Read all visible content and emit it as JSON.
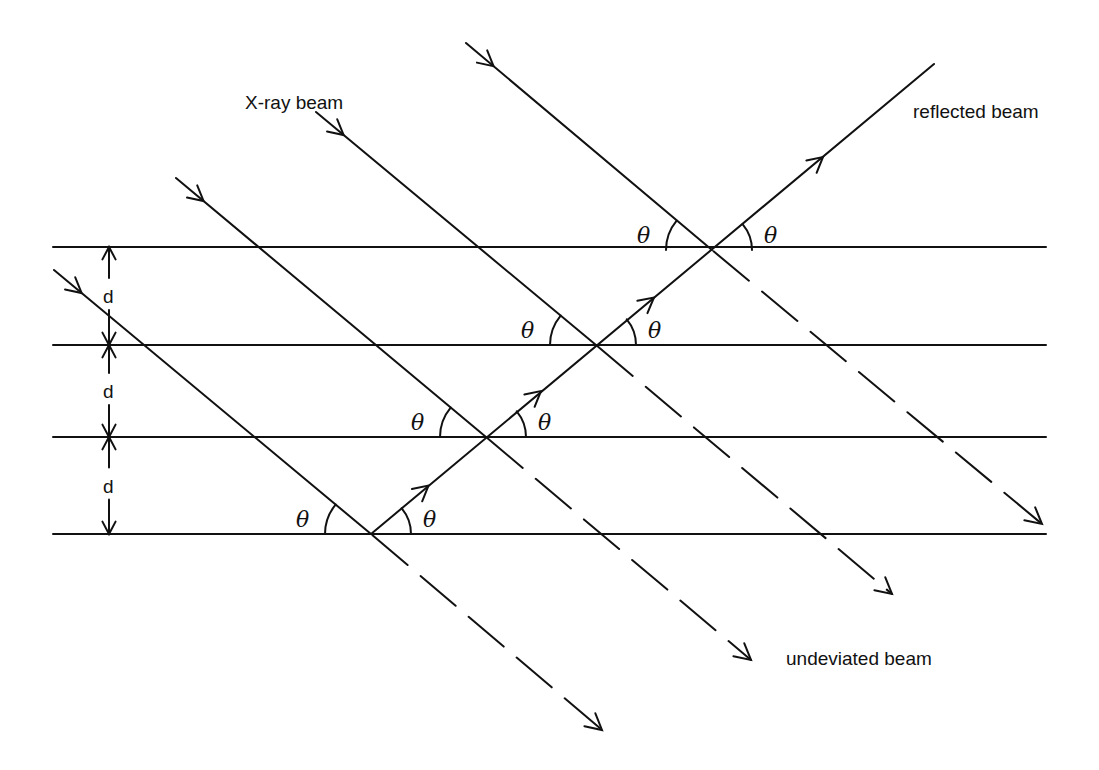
{
  "diagram": {
    "labels": {
      "incident": "X-ray beam",
      "reflected": "reflected beam",
      "undeviated": "undeviated beam",
      "spacing": "d",
      "angle": "θ"
    },
    "planes": {
      "count": 4,
      "y": [
        247,
        345,
        437,
        534
      ],
      "x_start": 53,
      "x_end": 1046
    },
    "spacing_markers": [
      {
        "label": "d",
        "between": [
          0,
          1
        ]
      },
      {
        "label": "d",
        "between": [
          1,
          2
        ]
      },
      {
        "label": "d",
        "between": [
          2,
          3
        ]
      }
    ],
    "incident_beams": [
      {
        "start": [
          54,
          270
        ],
        "hit": [
          371,
          534
        ],
        "end": [
          602,
          730
        ]
      },
      {
        "start": [
          176,
          178
        ],
        "hit": [
          486,
          437
        ],
        "end": [
          751,
          660
        ]
      },
      {
        "start": [
          316,
          112
        ],
        "hit": [
          596,
          345
        ],
        "end": [
          892,
          594
        ]
      },
      {
        "start": [
          466,
          43
        ],
        "hit": [
          712,
          250
        ],
        "end": [
          1042,
          524
        ]
      }
    ],
    "reflected_beam": {
      "start": [
        371,
        534
      ],
      "end": [
        934,
        64
      ]
    },
    "angle_markers_per_intersection": 2,
    "colors": {
      "line": "#111111",
      "background": "#ffffff"
    }
  }
}
